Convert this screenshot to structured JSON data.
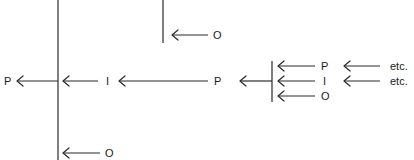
{
  "diagram": {
    "type": "hierarchical-flow",
    "colors": {
      "ink": "#2a2a2a",
      "background": "#ffffff"
    },
    "labels": {
      "root_p": "P",
      "main_i": "I",
      "main_p": "P",
      "top_o": "O",
      "bottom_o": "O",
      "right_p": "P",
      "right_i": "I",
      "right_o": "O",
      "etc_1": "etc.",
      "etc_2": "etc."
    }
  }
}
